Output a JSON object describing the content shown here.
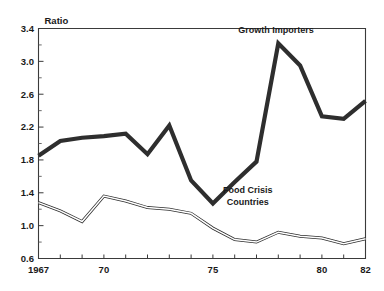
{
  "chart_data": {
    "type": "line",
    "title": "",
    "xlabel": "",
    "ylabel": "Ratio",
    "ylim": [
      0.6,
      3.4
    ],
    "xlim": [
      1967,
      1982
    ],
    "grid": false,
    "legend_position": "inline-annotations",
    "y_ticks": [
      "0.6",
      "1.0",
      "1.4",
      "1.8",
      "2.2",
      "2.6",
      "3.0",
      "3.4"
    ],
    "y_tick_values": [
      0.6,
      1.0,
      1.4,
      1.8,
      2.2,
      2.6,
      3.0,
      3.4
    ],
    "y_minor_step": 0.2,
    "x_ticks": [
      "1967",
      "70",
      "75",
      "80",
      "82"
    ],
    "x_tick_values": [
      1967,
      1970,
      1975,
      1980,
      1982
    ],
    "x": [
      1967,
      1968,
      1969,
      1970,
      1971,
      1972,
      1973,
      1974,
      1975,
      1976,
      1977,
      1978,
      1979,
      1980,
      1981,
      1982
    ],
    "series": [
      {
        "name": "Growth Importers",
        "style": "bold-solid",
        "color": "#2e2e2e",
        "values": [
          1.85,
          2.03,
          2.07,
          2.09,
          2.12,
          1.87,
          2.22,
          1.55,
          1.27,
          1.53,
          1.78,
          3.22,
          2.95,
          2.33,
          2.3,
          2.52
        ],
        "label_x": 1978,
        "label_y": 3.35
      },
      {
        "name": "Food Crisis Countries",
        "style": "thin-double",
        "color": "#2e2e2e",
        "values": [
          1.28,
          1.18,
          1.05,
          1.36,
          1.3,
          1.22,
          1.2,
          1.15,
          0.97,
          0.83,
          0.8,
          0.92,
          0.87,
          0.85,
          0.78,
          0.84
        ],
        "label_x": 1976.6,
        "label_y": 1.35
      }
    ],
    "annotations": [
      {
        "text": "Growth Importers",
        "x": 1977.9,
        "y": 3.34
      },
      {
        "text": "Food Crisis",
        "x": 1976.6,
        "y": 1.4
      },
      {
        "text": "Countries",
        "x": 1976.6,
        "y": 1.25
      }
    ]
  }
}
